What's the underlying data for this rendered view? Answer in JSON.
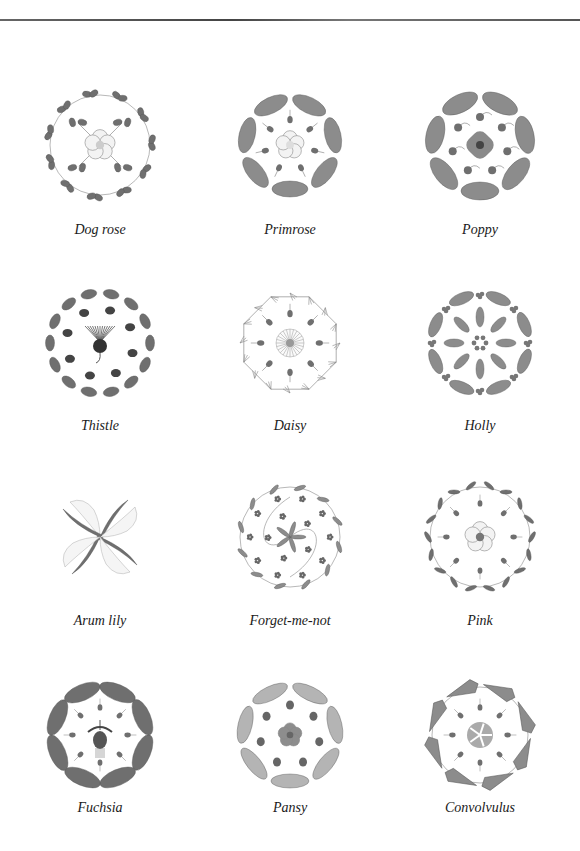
{
  "page": {
    "top_rule": true
  },
  "figures": [
    {
      "label": "Dog rose",
      "motif": "leafy-vine-wreath",
      "center": "five-petal-rose"
    },
    {
      "label": "Primrose",
      "motif": "crinkled-leaf-ring",
      "center": "five-petal-primrose"
    },
    {
      "label": "Poppy",
      "motif": "lobed-leaf-ring",
      "center": "four-petal-poppy"
    },
    {
      "label": "Thistle",
      "motif": "spiny-leaf-ring",
      "center": "thistle-head"
    },
    {
      "label": "Daisy",
      "motif": "feathery-stem-ring",
      "center": "daisy-flower"
    },
    {
      "label": "Holly",
      "motif": "holly-leaf-ring",
      "center": "berry-cluster"
    },
    {
      "label": "Arum lily",
      "motif": "pinwheel-leaves",
      "center": "spathe-swirl"
    },
    {
      "label": "Forget-me-not",
      "motif": "scrolling-vine-circle",
      "center": "leaf-rosette"
    },
    {
      "label": "Pink",
      "motif": "slender-leaf-vine-ring",
      "center": "pink-flower"
    },
    {
      "label": "Fuchsia",
      "motif": "oval-leaf-ring",
      "center": "fuchsia-bloom"
    },
    {
      "label": "Pansy",
      "motif": "serrated-leaf-ring",
      "center": "pansy-flower"
    },
    {
      "label": "Convolvulus",
      "motif": "arrow-leaf-ring",
      "center": "convolvulus-disc"
    }
  ],
  "colors": {
    "ink": "#1a1a1a",
    "leaf_dark": "#6f6f6f",
    "leaf_mid": "#8c8c8c",
    "leaf_light": "#b4b4b4",
    "stem": "#9a9a9a",
    "flower_fill": "#f3f3f3"
  }
}
